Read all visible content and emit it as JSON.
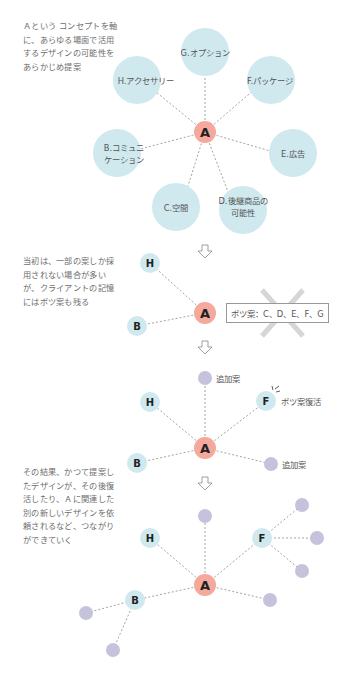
{
  "notes": {
    "intro": "Ａという コンセプトを軸\nに、あらゆる場面で活用\nするデザインの可能性を\nあらかじめ提案",
    "middle": "当初は、一部の案しか採\n用されない場合が多い\nが、クライアントの記憶\nにはボツ案も残る",
    "result": "その結果、かつて提案し\nたデザインが、その後復\n活したり、Ａに関連した\n別の新しいデザインを依\n頼されるなど、つながり\nができていく"
  },
  "diagram1": {
    "center": "A",
    "nodes": [
      {
        "id": "G",
        "label": "G.オプション"
      },
      {
        "id": "H",
        "label": "H.アクセサリー"
      },
      {
        "id": "F",
        "label": "F.パッケージ"
      },
      {
        "id": "B",
        "label_line1": "B.コミュニ",
        "label_line2": "ケーション"
      },
      {
        "id": "E",
        "label": "E.広告"
      },
      {
        "id": "C",
        "label": "C.空間"
      },
      {
        "id": "D",
        "label_line1": "D.後継商品の",
        "label_line2": "可能性"
      }
    ]
  },
  "diagram2": {
    "center": "A",
    "nodes": [
      "H",
      "B"
    ],
    "rejected_label": "ボツ案：C、D、E、F、G"
  },
  "diagram3": {
    "center": "A",
    "nodes": [
      "H",
      "F",
      "B"
    ],
    "added_label_top": "追加案",
    "added_label_right": "追加案",
    "revived_label": "ボツ案復活"
  },
  "diagram4": {
    "center": "A",
    "nodes": [
      "H",
      "F",
      "B"
    ]
  },
  "colors": {
    "center_node": "#f4a99c",
    "option_node": "#cfe9ef",
    "added_node": "#c5c3dc",
    "edge": "#9a9a9a",
    "cross": "#d6d6d6"
  }
}
